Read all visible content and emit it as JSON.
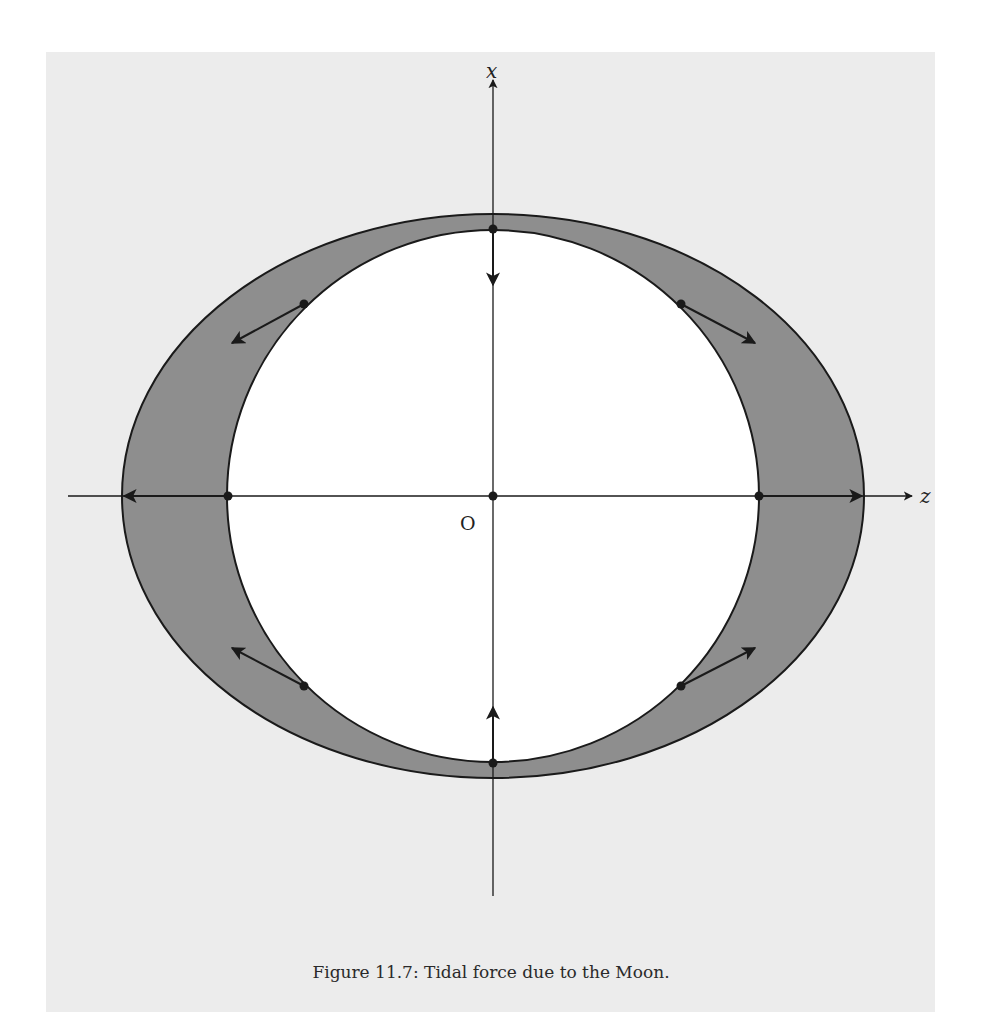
{
  "figure": {
    "caption": "Figure 11.7: Tidal force due to the Moon.",
    "axes": {
      "vertical_label": "x",
      "horizontal_label": "z",
      "origin_label": "O"
    },
    "colors": {
      "panel_background": "#ececec",
      "tidal_bulge_fill": "#8e8e8e",
      "earth_fill": "#ffffff",
      "stroke": "#1a1a1a"
    },
    "shapes": {
      "origin_px": [
        493,
        496
      ],
      "earth_circle_radius_px": 266,
      "tidal_ellipse_semi_axes_px": {
        "z": 371,
        "x": 282
      }
    },
    "force_vectors": [
      {
        "position": "top",
        "point": [
          493,
          229
        ],
        "direction": "toward center"
      },
      {
        "position": "bottom",
        "point": [
          493,
          763
        ],
        "direction": "toward center"
      },
      {
        "position": "left",
        "point": [
          228,
          496
        ],
        "direction": "away from center"
      },
      {
        "position": "right",
        "point": [
          759,
          496
        ],
        "direction": "away from center"
      },
      {
        "position": "upper-left",
        "point": [
          304,
          304
        ],
        "direction": "outward-left"
      },
      {
        "position": "upper-right",
        "point": [
          681,
          304
        ],
        "direction": "outward-right"
      },
      {
        "position": "lower-left",
        "point": [
          304,
          686
        ],
        "direction": "outward-left"
      },
      {
        "position": "lower-right",
        "point": [
          681,
          686
        ],
        "direction": "outward-right"
      }
    ]
  }
}
